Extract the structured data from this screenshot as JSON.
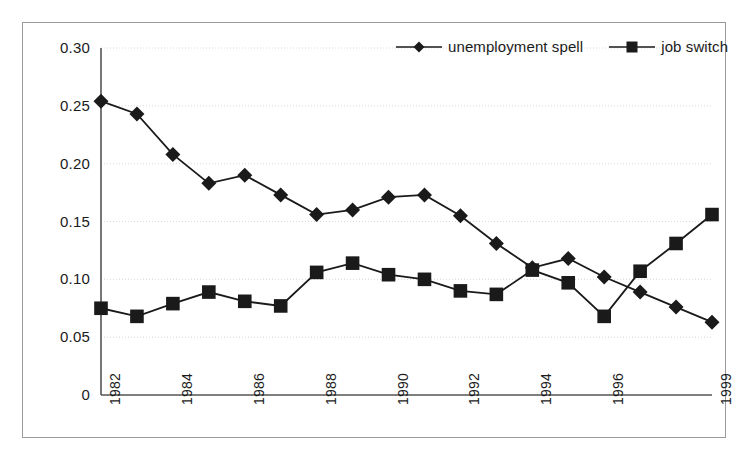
{
  "chart_data": {
    "type": "line",
    "title": "",
    "xlabel": "",
    "ylabel": "",
    "x": [
      1982,
      1983,
      1984,
      1985,
      1986,
      1987,
      1988,
      1989,
      1990,
      1991,
      1992,
      1993,
      1994,
      1995,
      1996,
      1997,
      1998,
      1999
    ],
    "xtick_labels": [
      "1982",
      "1984",
      "1986",
      "1988",
      "1990",
      "1992",
      "1994",
      "1996",
      "1999"
    ],
    "xtick_values": [
      1982,
      1984,
      1986,
      1988,
      1990,
      1992,
      1994,
      1996,
      1999
    ],
    "ytick_labels": [
      "0",
      "0.05",
      "0.10",
      "0.15",
      "0.20",
      "0.25",
      "0.30"
    ],
    "ytick_values": [
      0,
      0.05,
      0.1,
      0.15,
      0.2,
      0.25,
      0.3
    ],
    "ylim": [
      0,
      0.3
    ],
    "xlim": [
      1982,
      1999
    ],
    "grid": true,
    "legend_position": "top-right",
    "series": [
      {
        "name": "unemployment spell",
        "marker": "diamond",
        "color": "#1a1a1a",
        "values": [
          0.254,
          0.243,
          0.208,
          0.183,
          0.19,
          0.173,
          0.156,
          0.16,
          0.171,
          0.173,
          0.155,
          0.131,
          0.11,
          0.118,
          0.102,
          0.089,
          0.076,
          0.063
        ]
      },
      {
        "name": "job switch",
        "marker": "square",
        "color": "#1a1a1a",
        "values": [
          0.075,
          0.068,
          0.079,
          0.089,
          0.081,
          0.077,
          0.106,
          0.114,
          0.104,
          0.1,
          0.09,
          0.087,
          0.108,
          0.097,
          0.068,
          0.107,
          0.131,
          0.156
        ]
      }
    ]
  },
  "legend": {
    "items": [
      {
        "label": "unemployment spell",
        "marker": "diamond"
      },
      {
        "label": "job switch",
        "marker": "square"
      }
    ]
  }
}
